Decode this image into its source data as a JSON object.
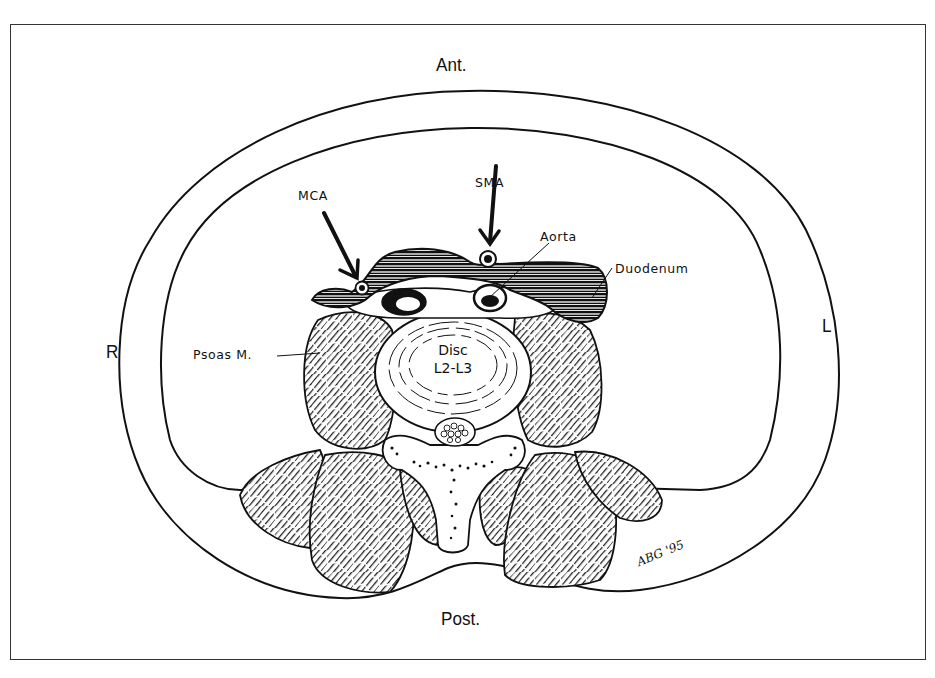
{
  "figure": {
    "type": "axial cross-section illustration",
    "orientation": {
      "anterior": "Ant.",
      "posterior": "Post.",
      "right": "R",
      "left": "L"
    },
    "labels": {
      "sma": "SMA",
      "mca": "MCA",
      "aorta": "Aorta",
      "duodenum": "Duodenum",
      "psoas": "Psoas M.",
      "disc_line1": "Disc",
      "disc_line2": "L2-L3"
    },
    "signature": "ABG '95",
    "colors": {
      "ink": "#111111",
      "background": "#ffffff",
      "frame": "#333333"
    }
  }
}
